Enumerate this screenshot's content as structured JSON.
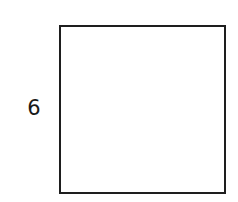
{
  "diagram": {
    "shape": "square",
    "side_label": "6",
    "stroke_color": "#1e1e1e",
    "fill_color": "#ffffff"
  }
}
